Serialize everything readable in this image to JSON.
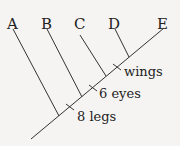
{
  "diagram": {
    "type": "cladogram",
    "taxa": [
      "A",
      "B",
      "C",
      "D",
      "E"
    ],
    "traits": [
      {
        "label": "8 legs",
        "position": "between A and B"
      },
      {
        "label": "6 eyes",
        "position": "between B and C"
      },
      {
        "label": "wings",
        "position": "between C and D"
      }
    ]
  }
}
